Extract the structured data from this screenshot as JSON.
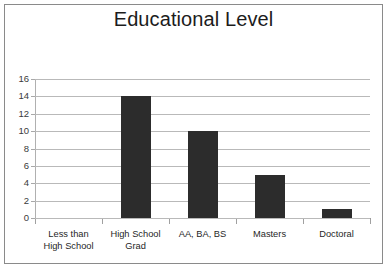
{
  "chart_data": {
    "type": "bar",
    "title": "Educational Level",
    "xlabel": "",
    "ylabel": "",
    "categories": [
      "Less than\nHigh School",
      "High School\nGrad",
      "AA, BA, BS",
      "Masters",
      "Doctoral"
    ],
    "values": [
      0,
      14,
      10,
      5,
      1
    ],
    "ylim": [
      0,
      16
    ],
    "ytick_values": [
      0,
      2,
      4,
      6,
      8,
      10,
      12,
      14,
      16
    ],
    "ytick_labels": [
      "0",
      "2",
      "4",
      "6",
      "8",
      "10",
      "12",
      "14",
      "16"
    ],
    "grid": true,
    "legend": false,
    "legend_position": "none",
    "bar_color": "#2c2c2c",
    "gridline_color": "#b9b9b9",
    "axis_color": "#a0a0a0",
    "title_color": "#1c1c1c",
    "background_color": "#ffffff",
    "border_color": "#8a8a8a"
  }
}
